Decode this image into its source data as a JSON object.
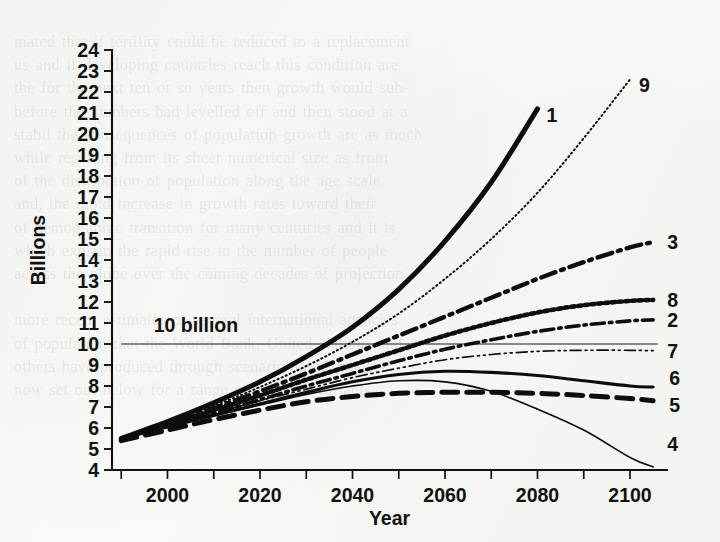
{
  "figure": {
    "background_color": "#fbfbfa",
    "ink_color": "#0d0d0d"
  },
  "bleed_text": "mated that if tertility could be reduced to a replacement\nus and if developing countries reach this condition are\nthe for the next ten or so years then growth would sub-\nbefore the numbers had levelled off and then stood at a\nstabil the consequences of population growth are as much\nwhile resulting from its sheer numerical size as from\nof the distribution of population along the age scale.\nand, the rapid increase in growth rates toward their\nof demographic transition for many centuries and it is\nwhich explain the rapid rise in the number of people\nacross the globe over the coming decades of projection.\n\nmore recent estimates of several international agencies\nof population that the World Bank, United Nations and\nothers have produced through scenario-based models\nnow set out below for a range of possible variants.",
  "chart_data": {
    "type": "line",
    "title": "",
    "xlabel": "Year",
    "ylabel": "Billions",
    "xlim": [
      1988,
      2108
    ],
    "ylim": [
      4,
      24
    ],
    "x_ticks_major": [
      2000,
      2020,
      2040,
      2060,
      2080,
      2100
    ],
    "x_ticks_minor": [
      1990,
      2010,
      2030,
      2050,
      2070,
      2090
    ],
    "y_ticks": [
      4,
      5,
      6,
      7,
      8,
      9,
      10,
      11,
      12,
      13,
      14,
      15,
      16,
      17,
      18,
      19,
      20,
      21,
      22,
      23,
      24
    ],
    "grid": false,
    "legend_position": "right-of-curve-end",
    "reference_line": {
      "label": "10 billion",
      "value": 10,
      "x_start": 1990,
      "x_end": 2106
    },
    "series": [
      {
        "name": "1",
        "label": "1",
        "style": "solid-thick",
        "stroke_width": 5.0,
        "dash": "none",
        "x": [
          1990,
          2000,
          2010,
          2020,
          2030,
          2040,
          2050,
          2060,
          2070,
          2080
        ],
        "values": [
          5.5,
          6.3,
          7.2,
          8.2,
          9.4,
          10.8,
          12.6,
          14.9,
          17.7,
          21.2
        ]
      },
      {
        "name": "9",
        "label": "9",
        "style": "fine-dotted",
        "stroke_width": 2.0,
        "dash": "1.2 3.2",
        "x": [
          1990,
          2000,
          2010,
          2020,
          2030,
          2040,
          2050,
          2060,
          2070,
          2080,
          2090,
          2100
        ],
        "values": [
          5.5,
          6.25,
          7.05,
          7.95,
          8.95,
          10.1,
          11.45,
          13.1,
          15.0,
          17.2,
          19.8,
          22.6
        ]
      },
      {
        "name": "3",
        "label": "3",
        "style": "dash-dot-thick",
        "stroke_width": 4.4,
        "dash": "15 6 3 6",
        "x": [
          1990,
          2000,
          2010,
          2020,
          2030,
          2040,
          2050,
          2060,
          2070,
          2080,
          2090,
          2100,
          2105
        ],
        "values": [
          5.5,
          6.2,
          6.95,
          7.75,
          8.6,
          9.5,
          10.4,
          11.3,
          12.2,
          13.1,
          13.9,
          14.6,
          14.85
        ]
      },
      {
        "name": "8",
        "label": "8",
        "style": "thick-dotted",
        "stroke_width": 4.6,
        "dash": "3.4 3.4",
        "x": [
          1990,
          2000,
          2010,
          2020,
          2030,
          2040,
          2050,
          2060,
          2070,
          2080,
          2090,
          2100,
          2105
        ],
        "values": [
          5.5,
          6.15,
          6.85,
          7.55,
          8.3,
          9.0,
          9.7,
          10.4,
          11.0,
          11.5,
          11.85,
          12.05,
          12.1
        ]
      },
      {
        "name": "2",
        "label": "2",
        "style": "dash-dot-medium",
        "stroke_width": 3.6,
        "dash": "13 5 2.5 5",
        "x": [
          1990,
          2000,
          2010,
          2020,
          2030,
          2040,
          2050,
          2060,
          2070,
          2080,
          2090,
          2100,
          2105
        ],
        "values": [
          5.5,
          6.1,
          6.7,
          7.35,
          8.0,
          8.6,
          9.2,
          9.75,
          10.2,
          10.6,
          10.9,
          11.1,
          11.15
        ]
      },
      {
        "name": "7",
        "label": "7",
        "style": "thin-dash-dot-dot",
        "stroke_width": 1.7,
        "dash": "11 4 2 4 2 4",
        "x": [
          1990,
          2000,
          2010,
          2020,
          2030,
          2040,
          2050,
          2060,
          2070,
          2080,
          2090,
          2100,
          2105
        ],
        "values": [
          5.5,
          6.1,
          6.7,
          7.3,
          7.85,
          8.4,
          8.85,
          9.25,
          9.5,
          9.65,
          9.7,
          9.7,
          9.68
        ]
      },
      {
        "name": "6",
        "label": "6",
        "style": "solid-medium",
        "stroke_width": 3.1,
        "dash": "none",
        "x": [
          1990,
          2000,
          2010,
          2020,
          2030,
          2040,
          2050,
          2060,
          2070,
          2080,
          2090,
          2100,
          2105
        ],
        "values": [
          5.5,
          6.05,
          6.6,
          7.15,
          7.7,
          8.2,
          8.55,
          8.7,
          8.65,
          8.5,
          8.25,
          8.0,
          7.95
        ]
      },
      {
        "name": "5",
        "label": "5",
        "style": "thick-dashed",
        "stroke_width": 5.0,
        "dash": "16 9",
        "x": [
          1990,
          2000,
          2010,
          2020,
          2030,
          2040,
          2050,
          2060,
          2070,
          2080,
          2090,
          2100,
          2105
        ],
        "values": [
          5.4,
          5.9,
          6.4,
          6.85,
          7.25,
          7.5,
          7.65,
          7.7,
          7.7,
          7.65,
          7.55,
          7.4,
          7.3
        ]
      },
      {
        "name": "4",
        "label": "4",
        "style": "thin-solid",
        "stroke_width": 1.7,
        "dash": "none",
        "x": [
          1990,
          2000,
          2010,
          2020,
          2030,
          2040,
          2050,
          2060,
          2070,
          2080,
          2090,
          2100,
          2105
        ],
        "values": [
          5.5,
          6.05,
          6.6,
          7.1,
          7.6,
          8.0,
          8.25,
          8.2,
          7.75,
          6.9,
          5.9,
          4.6,
          4.15
        ]
      }
    ]
  }
}
